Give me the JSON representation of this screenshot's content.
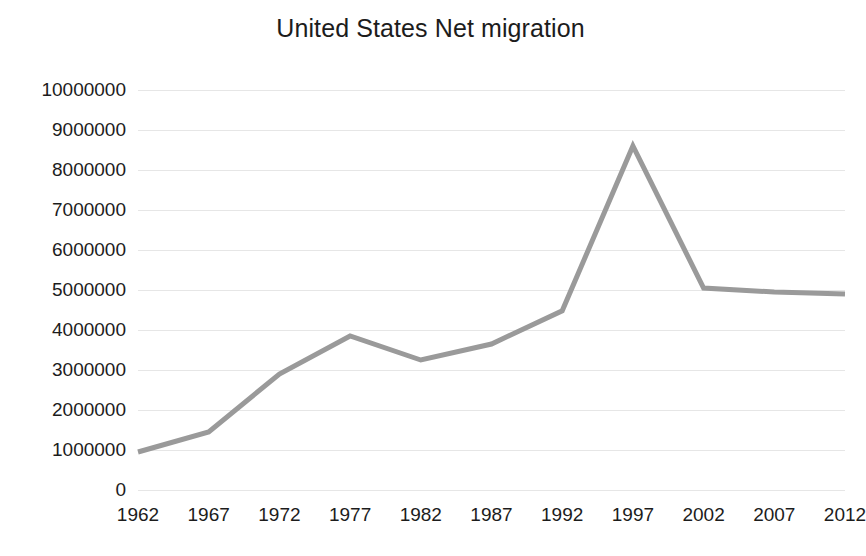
{
  "chart_data": {
    "type": "line",
    "title": "United States Net migration",
    "xlabel": "",
    "ylabel": "",
    "categories": [
      "1962",
      "1967",
      "1972",
      "1977",
      "1982",
      "1987",
      "1992",
      "1997",
      "2002",
      "2007",
      "2012"
    ],
    "values": [
      950000,
      1450000,
      2900000,
      3850000,
      3250000,
      3650000,
      4480000,
      8600000,
      5050000,
      4950000,
      4900000
    ],
    "series": [
      {
        "name": "Net migration",
        "values": [
          950000,
          1450000,
          2900000,
          3850000,
          3250000,
          3650000,
          4480000,
          8600000,
          5050000,
          4950000,
          4900000
        ],
        "color": "#9a9a9a"
      }
    ],
    "ylim": [
      0,
      10000000
    ],
    "ytick_labels": [
      "10000000",
      "9000000",
      "8000000",
      "7000000",
      "6000000",
      "5000000",
      "4000000",
      "3000000",
      "2000000",
      "1000000",
      "0"
    ],
    "ytick_values": [
      10000000,
      9000000,
      8000000,
      7000000,
      6000000,
      5000000,
      4000000,
      3000000,
      2000000,
      1000000,
      0
    ],
    "grid": true,
    "grid_color": "#e6e6e6",
    "legend": false,
    "legend_position": "none",
    "line_color": "#9a9a9a",
    "line_width": 5,
    "markers": false,
    "background_color": "#ffffff",
    "text_color": "#1c1c1c"
  }
}
